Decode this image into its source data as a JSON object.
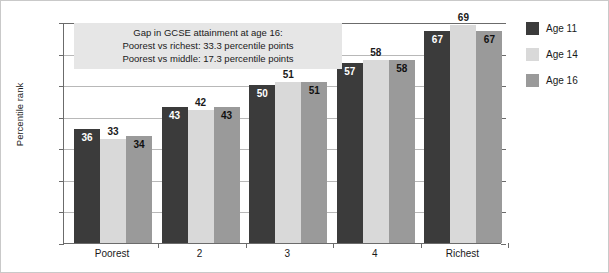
{
  "chart_data": {
    "type": "bar",
    "title": "",
    "xlabel": "",
    "ylabel": "Percentile rank",
    "ylim": [
      0,
      70
    ],
    "yticks": [
      0,
      10,
      20,
      30,
      40,
      50,
      60,
      70
    ],
    "grid": true,
    "legend_position": "right",
    "categories": [
      "Poorest",
      "2",
      "3",
      "4",
      "Richest"
    ],
    "series": [
      {
        "name": "Age 11",
        "color": "#3b3b3b",
        "values": [
          36,
          43,
          50,
          57,
          67
        ]
      },
      {
        "name": "Age 14",
        "color": "#d9d9d9",
        "values": [
          33,
          42,
          51,
          58,
          69
        ]
      },
      {
        "name": "Age 16",
        "color": "#9a9a9a",
        "values": [
          34,
          43,
          51,
          58,
          67
        ]
      }
    ],
    "annotations": [
      "Gap in GCSE attainment at age 16:",
      "Poorest vs richest: 33.3 percentile points",
      "Poorest vs middle: 17.3 percentile points"
    ]
  }
}
